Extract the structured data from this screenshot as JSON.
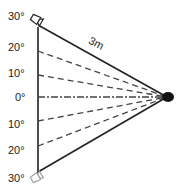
{
  "diagram": {
    "type": "camera-coverage-angle-diagram",
    "distance_label": "3m",
    "angle_labels": [
      {
        "text": "30°",
        "side": "top"
      },
      {
        "text": "20°",
        "side": "top"
      },
      {
        "text": "10°",
        "side": "top"
      },
      {
        "text": "0°",
        "side": "center"
      },
      {
        "text": "10°",
        "side": "bottom"
      },
      {
        "text": "20°",
        "side": "bottom"
      },
      {
        "text": "30°",
        "side": "bottom"
      }
    ],
    "elements": {
      "target_point": "filled black circle (subject)",
      "top_device": "camera icon at top",
      "bottom_device": "camera icon at bottom",
      "center_line": "dash-dot line (0°)",
      "angle_lines": "dashed lines at 10° and 20°",
      "boundary_lines": "solid lines at 30°"
    },
    "colors": {
      "line": "#222222",
      "dashed": "#444444",
      "text": "#222222",
      "background": "#ffffff"
    }
  }
}
